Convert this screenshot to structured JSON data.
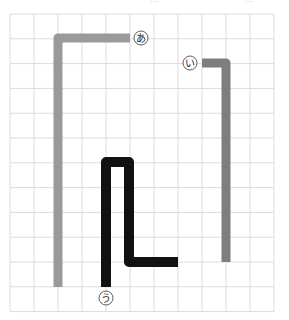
{
  "header": {
    "cut_text_left": "…",
    "cut_text_right": "…"
  },
  "grid": {
    "x0": 10,
    "y0": 14,
    "cols": 11,
    "rows": 12,
    "cell_w": 24,
    "cell_h": 24.8,
    "line_color": "#dcdcdc"
  },
  "paths": [
    {
      "id": "a",
      "label": "あ",
      "color": "#9a9a9a",
      "width": 9,
      "points": [
        [
          130,
          38
        ],
        [
          58,
          38
        ],
        [
          58,
          287
        ]
      ],
      "label_pos": [
        141,
        38
      ]
    },
    {
      "id": "i",
      "label": "い",
      "color": "#7e7e7e",
      "width": 9,
      "points": [
        [
          202,
          63
        ],
        [
          226,
          63
        ],
        [
          226,
          262
        ]
      ],
      "label_pos": [
        190,
        63
      ]
    },
    {
      "id": "u",
      "label": "う",
      "color": "#111111",
      "width": 10,
      "points": [
        [
          106,
          287
        ],
        [
          106,
          162
        ],
        [
          129,
          162
        ],
        [
          129,
          262
        ],
        [
          178,
          262
        ]
      ],
      "label_pos": [
        106,
        298
      ]
    }
  ],
  "label_circle": {
    "radius": 7,
    "stroke": "#333333"
  }
}
